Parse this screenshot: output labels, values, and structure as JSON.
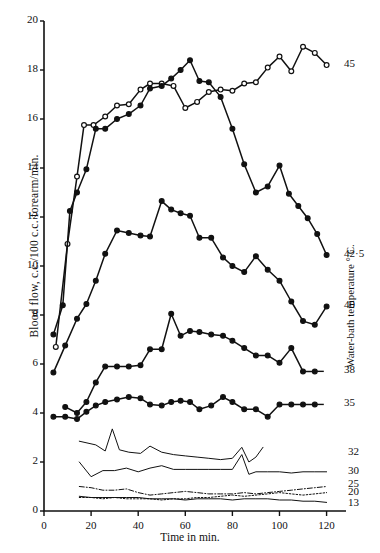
{
  "figure": {
    "title": "",
    "y_axis_label": "Blood flow, c.c./100 c.c. forearm/min.",
    "x_axis_label": "Time in min.",
    "right_axis_label": "Water-bath temperature ° C."
  },
  "chart_data": {
    "type": "line",
    "title": "",
    "xlabel": "Time in min.",
    "ylabel": "Blood flow, c.c./100 c.c. forearm/min.",
    "right_ylabel": "Water-bath temperature ° C.",
    "xlim": [
      0,
      124
    ],
    "ylim": [
      0,
      20
    ],
    "xticks": [
      0,
      20,
      40,
      60,
      80,
      100,
      120
    ],
    "yticks": [
      0,
      2,
      4,
      6,
      8,
      10,
      12,
      14,
      16,
      18,
      20
    ],
    "grid": false,
    "legend_position": "right-of-axes",
    "legend_note": "Series labelled at right-hand end by water-bath temperature in degrees C.",
    "series": [
      {
        "name": "45",
        "label": "45",
        "marker": "open-circle",
        "linestyle": "solid",
        "x": [
          5,
          10,
          14,
          17,
          21,
          26,
          31,
          36,
          41,
          45,
          50,
          55,
          60,
          65,
          70,
          75,
          80,
          85,
          90,
          95,
          100,
          105,
          110,
          115,
          120
        ],
        "y": [
          6.7,
          10.9,
          13.65,
          15.75,
          15.75,
          16.1,
          16.55,
          16.6,
          17.2,
          17.45,
          17.45,
          17.35,
          16.45,
          16.7,
          17.1,
          17.2,
          17.15,
          17.45,
          17.5,
          18.1,
          18.55,
          17.95,
          18.95,
          18.7,
          18.2
        ]
      },
      {
        "name": "42.5",
        "label": "42·5",
        "marker": "filled-circle",
        "linestyle": "solid",
        "x": [
          4,
          8,
          11,
          14,
          18,
          22,
          26,
          31,
          36,
          41,
          45,
          50,
          54,
          58,
          62,
          66,
          70,
          75,
          80,
          85,
          90,
          95,
          100,
          104,
          108,
          112,
          116,
          120
        ],
        "y": [
          7.2,
          8.4,
          12.25,
          13.0,
          13.95,
          15.6,
          15.6,
          16.0,
          16.2,
          16.55,
          17.25,
          17.35,
          17.65,
          18.0,
          18.4,
          17.55,
          17.5,
          16.9,
          15.6,
          14.15,
          13.0,
          13.25,
          14.1,
          12.95,
          12.45,
          11.95,
          11.3,
          10.45
        ]
      },
      {
        "name": "40",
        "label": "40",
        "marker": "filled-circle",
        "linestyle": "solid",
        "x": [
          4,
          9,
          14,
          18,
          22,
          26,
          31,
          36,
          41,
          45,
          50,
          54,
          58,
          62,
          66,
          71,
          76,
          80,
          85,
          90,
          95,
          100,
          105,
          110,
          115,
          120
        ],
        "y": [
          5.65,
          6.75,
          7.85,
          8.45,
          9.4,
          10.5,
          11.45,
          11.35,
          11.25,
          11.2,
          12.65,
          12.3,
          12.15,
          12.05,
          11.15,
          11.15,
          10.35,
          10.0,
          9.75,
          10.4,
          9.85,
          9.4,
          8.55,
          7.75,
          7.6,
          8.35
        ]
      },
      {
        "name": "38",
        "label": "38",
        "marker": "filled-circle",
        "linestyle": "solid",
        "x": [
          9,
          14,
          18,
          22,
          26,
          31,
          36,
          41,
          45,
          50,
          54,
          58,
          62,
          66,
          71,
          76,
          80,
          85,
          90,
          95,
          100,
          105,
          110,
          115
        ],
        "y": [
          4.25,
          4.0,
          4.45,
          5.25,
          5.9,
          5.9,
          5.9,
          5.95,
          6.6,
          6.6,
          8.05,
          7.15,
          7.35,
          7.3,
          7.2,
          7.15,
          6.95,
          6.65,
          6.35,
          6.35,
          6.05,
          6.65,
          5.7,
          5.7
        ]
      },
      {
        "name": "35",
        "label": "35",
        "marker": "filled-circle",
        "linestyle": "solid",
        "x": [
          4,
          9,
          14,
          18,
          22,
          26,
          31,
          36,
          41,
          45,
          50,
          54,
          58,
          62,
          66,
          71,
          76,
          80,
          85,
          90,
          95,
          100,
          105,
          110,
          115
        ],
        "y": [
          3.85,
          3.85,
          3.75,
          4.05,
          4.3,
          4.45,
          4.55,
          4.65,
          4.6,
          4.35,
          4.3,
          4.45,
          4.5,
          4.45,
          4.15,
          4.3,
          4.65,
          4.45,
          4.15,
          4.15,
          3.85,
          4.35,
          4.35,
          4.35,
          4.35
        ]
      },
      {
        "name": "32",
        "label": "32",
        "marker": "none",
        "linestyle": "solid-thin",
        "x": [
          15,
          22,
          26,
          29,
          32,
          36,
          41,
          45,
          50,
          55,
          60,
          65,
          70,
          75,
          80,
          84,
          87,
          90,
          93
        ],
        "y": [
          2.85,
          2.7,
          2.45,
          3.35,
          2.5,
          2.4,
          2.35,
          2.65,
          2.4,
          2.3,
          2.25,
          2.2,
          2.15,
          2.1,
          2.15,
          2.6,
          2.0,
          2.2,
          2.6
        ]
      },
      {
        "name": "30",
        "label": "30",
        "marker": "none",
        "linestyle": "solid-thin",
        "x": [
          15,
          20,
          25,
          30,
          35,
          40,
          45,
          50,
          55,
          60,
          65,
          70,
          75,
          80,
          84,
          87,
          90,
          95,
          100,
          105,
          110,
          115,
          120
        ],
        "y": [
          2.0,
          1.4,
          1.65,
          1.65,
          1.75,
          1.6,
          1.75,
          1.85,
          1.7,
          1.7,
          1.7,
          1.7,
          1.7,
          1.7,
          2.3,
          1.5,
          1.6,
          1.6,
          1.6,
          1.55,
          1.6,
          1.6,
          1.6
        ]
      },
      {
        "name": "25",
        "label": "25",
        "marker": "none",
        "linestyle": "dash-dot",
        "x": [
          15,
          20,
          25,
          30,
          35,
          40,
          45,
          50,
          55,
          60,
          65,
          70,
          75,
          80,
          85,
          90,
          95,
          100,
          105,
          110,
          115,
          120
        ],
        "y": [
          1.0,
          0.95,
          0.85,
          0.85,
          0.9,
          0.75,
          0.65,
          0.7,
          0.75,
          0.8,
          0.75,
          0.7,
          0.7,
          0.7,
          0.75,
          0.7,
          0.75,
          0.8,
          0.85,
          0.9,
          0.95,
          1.0
        ]
      },
      {
        "name": "20",
        "label": "20",
        "marker": "none",
        "linestyle": "dotted",
        "x": [
          15,
          20,
          25,
          30,
          35,
          40,
          45,
          50,
          55,
          60,
          65,
          70,
          75,
          80,
          85,
          90,
          95,
          100,
          105,
          110,
          115,
          120
        ],
        "y": [
          0.55,
          0.55,
          0.5,
          0.55,
          0.5,
          0.5,
          0.5,
          0.45,
          0.5,
          0.5,
          0.55,
          0.55,
          0.6,
          0.65,
          0.6,
          0.65,
          0.7,
          0.75,
          0.7,
          0.65,
          0.7,
          0.75
        ]
      },
      {
        "name": "13",
        "label": "13",
        "marker": "none",
        "linestyle": "solid-thin",
        "x": [
          15,
          20,
          25,
          30,
          35,
          40,
          45,
          50,
          55,
          60,
          65,
          70,
          75,
          80,
          85,
          90,
          95,
          100,
          105,
          110,
          115,
          120
        ],
        "y": [
          0.6,
          0.55,
          0.55,
          0.55,
          0.55,
          0.55,
          0.5,
          0.5,
          0.5,
          0.45,
          0.5,
          0.5,
          0.5,
          0.45,
          0.5,
          0.5,
          0.5,
          0.45,
          0.45,
          0.4,
          0.4,
          0.35
        ]
      }
    ]
  },
  "axis_ticks": {
    "x": [
      "0",
      "20",
      "40",
      "60",
      "80",
      "100",
      "120"
    ],
    "y": [
      "0",
      "2",
      "4",
      "6",
      "8",
      "10",
      "12",
      "14",
      "16",
      "18",
      "20"
    ]
  },
  "colors": {
    "ink": "#111111",
    "background": "#ffffff"
  }
}
